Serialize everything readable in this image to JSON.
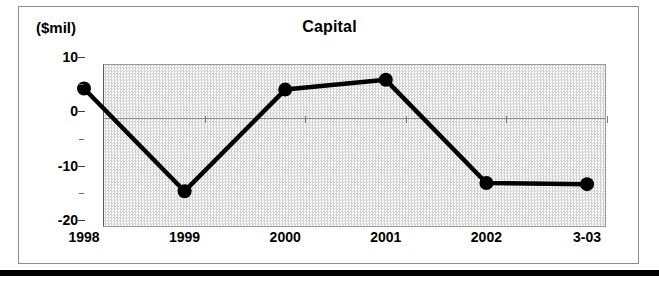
{
  "chart_data": {
    "type": "line",
    "title": "Capital",
    "ylabel": "($mil)",
    "xlabel": "",
    "categories": [
      "1998",
      "1999",
      "2000",
      "2001",
      "2002",
      "3-03"
    ],
    "values": [
      4.2,
      -14.7,
      4.0,
      5.8,
      -13.2,
      -13.4
    ],
    "series": [
      {
        "name": "Capital",
        "values": [
          4.2,
          -14.7,
          4.0,
          5.8,
          -13.2,
          -13.4
        ]
      }
    ],
    "ylim": [
      -20,
      10
    ],
    "y_ticks": [
      "10",
      "0",
      "-10",
      "-20"
    ],
    "y_tick_values": [
      10,
      0,
      -10,
      -20
    ],
    "y_minor_tick_values": [
      5,
      -5,
      -15
    ],
    "grid": false,
    "legend": "none",
    "marker": "filled-circle",
    "line_color": "#000000",
    "marker_color": "#000000",
    "plot_background": "#e4e4e4",
    "zero_line": 0
  },
  "figure": {
    "title": "Capital",
    "y_unit_caption": "($mil)"
  }
}
